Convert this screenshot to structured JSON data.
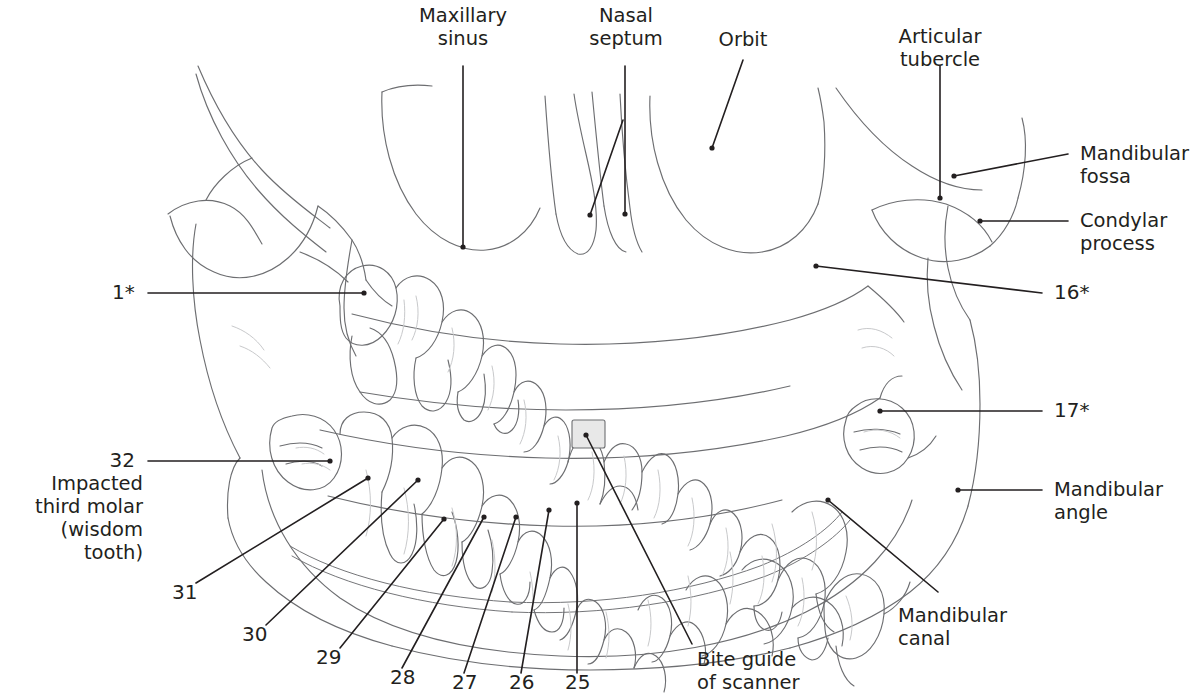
{
  "figure": {
    "background_color": "#ffffff",
    "anatomy_line_color": "#6d6e71",
    "leader_line_color": "#231f20",
    "text_color": "#231f20",
    "bite_guide_fill": "#e8e8e8"
  },
  "labels": {
    "maxillary_sinus": "Maxillary\nsinus",
    "nasal_septum": "Nasal\nseptum",
    "orbit": "Orbit",
    "articular_tubercle": "Articular\ntubercle",
    "mandibular_fossa": "Mandibular\nfossa",
    "condylar_process": "Condylar\nprocess",
    "mandibular_angle": "Mandibular\nangle",
    "mandibular_canal": "Mandibular\ncanal",
    "bite_guide": "Bite guide\nof scanner",
    "impacted_third_molar": "Impacted\nthird molar\n(wisdom tooth)"
  },
  "tooth_numbers": {
    "upper_left": "1*",
    "upper_right": "16*",
    "lower_right": "17*",
    "lower_left_third_molar": "32",
    "n31": "31",
    "n30": "30",
    "n29": "29",
    "n28": "28",
    "n27": "27",
    "n26": "26",
    "n25": "25"
  }
}
